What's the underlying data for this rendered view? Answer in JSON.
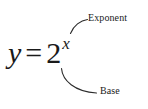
{
  "figure": {
    "background_color": "#ffffff",
    "text_color": "#1a1a1a",
    "leader_color": "#2b2b2b"
  },
  "equation": {
    "left_side": "y",
    "operator": "=",
    "base": "2",
    "exponent": "x",
    "full_text": "y = 2x"
  },
  "annotations": [
    {
      "id": "exponent",
      "label": "Exponent",
      "points_to": "exponent",
      "position": "upper-right"
    },
    {
      "id": "base",
      "label": "Base",
      "points_to": "base",
      "position": "lower-right"
    }
  ]
}
